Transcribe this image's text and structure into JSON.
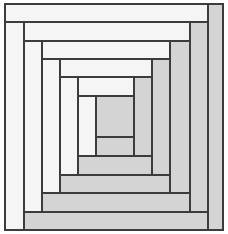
{
  "figure": {
    "pattern_name": "log-cabin",
    "width": 228,
    "height": 234,
    "background_color": "#ffffff",
    "stroke_color": "#3c3c3c",
    "stroke_width": 1.1
  },
  "palette": {
    "light": "#f5f5f5",
    "dark": "#d4d4d4",
    "center": "#d4d4d4",
    "outline": "#3c3c3c"
  },
  "geometry": {
    "frame": {
      "x": 5,
      "y": 4,
      "width": 218,
      "height": 226
    },
    "gridlines": {
      "vertical": [
        5,
        24,
        42,
        60,
        78,
        96,
        134,
        152,
        170,
        190,
        208,
        223
      ],
      "horizontal": [
        4,
        22,
        41,
        59,
        77,
        96,
        137,
        156,
        175,
        193,
        212,
        230
      ]
    },
    "center_square": {
      "x": 96,
      "y": 96,
      "width": 38,
      "height": 41
    }
  },
  "strips": [
    {
      "id": "r1-top",
      "ring": 1,
      "side": "top",
      "tone": "light",
      "x": 5,
      "y": 4,
      "width": 203,
      "height": 18
    },
    {
      "id": "r1-right",
      "ring": 1,
      "side": "right",
      "tone": "dark",
      "x": 208,
      "y": 4,
      "width": 15,
      "height": 226
    },
    {
      "id": "r1-bottom",
      "ring": 1,
      "side": "bottom",
      "tone": "dark",
      "x": 24,
      "y": 212,
      "width": 184,
      "height": 18
    },
    {
      "id": "r1-left",
      "ring": 1,
      "side": "left",
      "tone": "light",
      "x": 5,
      "y": 22,
      "width": 19,
      "height": 208
    },
    {
      "id": "r2-top",
      "ring": 2,
      "side": "top",
      "tone": "light",
      "x": 24,
      "y": 22,
      "width": 166,
      "height": 19
    },
    {
      "id": "r2-right",
      "ring": 2,
      "side": "right",
      "tone": "dark",
      "x": 190,
      "y": 22,
      "width": 18,
      "height": 190
    },
    {
      "id": "r2-bottom",
      "ring": 2,
      "side": "bottom",
      "tone": "dark",
      "x": 42,
      "y": 193,
      "width": 148,
      "height": 19
    },
    {
      "id": "r2-left",
      "ring": 2,
      "side": "left",
      "tone": "light",
      "x": 24,
      "y": 41,
      "width": 18,
      "height": 171
    },
    {
      "id": "r3-top",
      "ring": 3,
      "side": "top",
      "tone": "light",
      "x": 42,
      "y": 41,
      "width": 128,
      "height": 18
    },
    {
      "id": "r3-right",
      "ring": 3,
      "side": "right",
      "tone": "dark",
      "x": 170,
      "y": 41,
      "width": 20,
      "height": 152
    },
    {
      "id": "r3-bottom",
      "ring": 3,
      "side": "bottom",
      "tone": "dark",
      "x": 60,
      "y": 175,
      "width": 110,
      "height": 18
    },
    {
      "id": "r3-left",
      "ring": 3,
      "side": "left",
      "tone": "light",
      "x": 42,
      "y": 59,
      "width": 18,
      "height": 134
    },
    {
      "id": "r4-top",
      "ring": 4,
      "side": "top",
      "tone": "light",
      "x": 60,
      "y": 59,
      "width": 92,
      "height": 18
    },
    {
      "id": "r4-right",
      "ring": 4,
      "side": "right",
      "tone": "dark",
      "x": 152,
      "y": 59,
      "width": 18,
      "height": 116
    },
    {
      "id": "r4-bottom",
      "ring": 4,
      "side": "bottom",
      "tone": "dark",
      "x": 78,
      "y": 156,
      "width": 74,
      "height": 19
    },
    {
      "id": "r4-left",
      "ring": 4,
      "side": "left",
      "tone": "light",
      "x": 60,
      "y": 77,
      "width": 18,
      "height": 98
    },
    {
      "id": "r5-top",
      "ring": 5,
      "side": "top",
      "tone": "light",
      "x": 78,
      "y": 77,
      "width": 56,
      "height": 19
    },
    {
      "id": "r5-right",
      "ring": 5,
      "side": "right",
      "tone": "dark",
      "x": 134,
      "y": 77,
      "width": 18,
      "height": 79
    },
    {
      "id": "r5-bottom",
      "ring": 5,
      "side": "bottom",
      "tone": "dark",
      "x": 96,
      "y": 137,
      "width": 38,
      "height": 19
    },
    {
      "id": "r5-left",
      "ring": 5,
      "side": "left",
      "tone": "light",
      "x": 78,
      "y": 96,
      "width": 18,
      "height": 60
    },
    {
      "id": "center",
      "ring": 6,
      "side": "center",
      "tone": "center",
      "x": 96,
      "y": 96,
      "width": 38,
      "height": 41
    }
  ]
}
